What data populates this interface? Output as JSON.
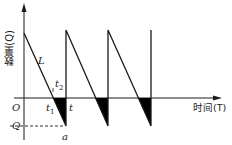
{
  "diagram": {
    "y_axis_label": "数量(Q)",
    "x_axis_label": "时间(T)",
    "labels": {
      "origin": "O",
      "line": "L",
      "t1": "t",
      "t1_sub": "1",
      "t2": "t",
      "t2_sub": "2",
      "t": "t",
      "q": "Q",
      "a": "a"
    },
    "colors": {
      "stroke": "#1a1a1a",
      "fill": "#000000",
      "background": "#ffffff"
    },
    "cycles": 3
  }
}
